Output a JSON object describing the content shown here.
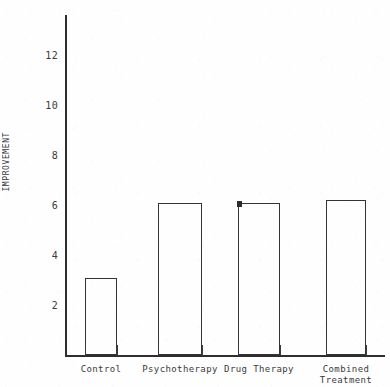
{
  "chart_data": {
    "type": "bar",
    "title": "",
    "subtitle": "",
    "xlabel": "",
    "ylabel": "IMPROVEMENT",
    "categories": [
      "Control",
      "Psychotherapy",
      "Drug Therapy",
      "Combined\nTreatment"
    ],
    "values": [
      3.1,
      6.1,
      6.1,
      6.2
    ],
    "series": [
      {
        "name": "Improvement",
        "values": [
          3.1,
          6.1,
          6.1,
          6.2
        ]
      }
    ],
    "ylim": [
      0,
      13.2
    ],
    "ytick_values": [
      2,
      4,
      6,
      8,
      10,
      12
    ],
    "ytick_labels": [
      "2",
      "4",
      "6",
      "8",
      "10",
      "12"
    ],
    "grid": false,
    "legend": false,
    "legend_position": "none",
    "annotations": [
      {
        "label": "marker-dot",
        "at_category": "Drug Therapy",
        "value": 6.1
      }
    ],
    "style": {
      "bar_fill": "none",
      "bar_outline": "#343434",
      "axis_color": "#2e2e2e",
      "text_color": "#3a3a3a",
      "background": "#fefefe"
    }
  }
}
